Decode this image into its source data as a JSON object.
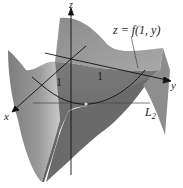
{
  "figure": {
    "axes": {
      "x_label": "x",
      "y_label": "y",
      "z_label": "z"
    },
    "annotations": {
      "surface_curve_label": "z = f(1, y)",
      "line_label": "L",
      "line_label_subscript": "2",
      "tick_x": "1",
      "tick_y": "1"
    },
    "colors": {
      "surface_dark": "#6f6f6f",
      "surface_mid": "#8a8a8a",
      "surface_light": "#b4b4b4",
      "axis": "#111111",
      "curve": "#1a1a1a",
      "point": "#d8d8d8"
    }
  }
}
